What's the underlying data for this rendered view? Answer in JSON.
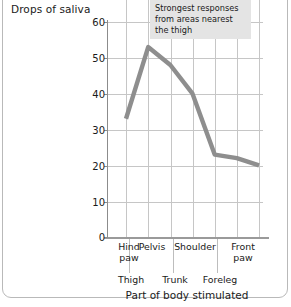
{
  "figure": {
    "annotation": "Strongest responses from areas nearest the thigh",
    "annotation_lines": [
      "Strongest responses",
      "from areas nearest",
      "the thigh"
    ],
    "frame_color": "#b9b9b9",
    "grid_color": "#c6c6c6",
    "axis_color": "#8c8c8c",
    "line_color": "#8e8e8e",
    "annotation_bg": "#e4e4e4",
    "text_color": "#1a1a1a"
  },
  "chart_data": {
    "type": "line",
    "title": "",
    "xlabel": "Part of body stimulated",
    "ylabel": "Drops of saliva",
    "categories": [
      "Hind paw",
      "Thigh",
      "Pelvis",
      "Trunk",
      "Shoulder",
      "Foreleg",
      "Front paw"
    ],
    "values": [
      33,
      53,
      48,
      40,
      23,
      22,
      20
    ],
    "ylim": [
      0,
      60
    ],
    "yticks": [
      0,
      10,
      20,
      30,
      40,
      50,
      60
    ],
    "ytick_labels": [
      "0",
      "10",
      "20",
      "30",
      "40",
      "50",
      "60"
    ],
    "grid": true,
    "legend": "none",
    "category_rows": {
      "top": [
        "Hind paw",
        "Pelvis",
        "Shoulder",
        "Front paw"
      ],
      "bottom": [
        "Thigh",
        "Trunk",
        "Foreleg"
      ]
    },
    "annotations": [
      {
        "text": "Strongest responses from areas nearest the thigh",
        "target": "Thigh"
      }
    ]
  },
  "labels": {
    "y_axis_title": "Drops of saliva",
    "x_axis_title": "Part of body stimulated",
    "x_top": [
      {
        "text_line1": "Hind",
        "text_line2": "paw"
      },
      {
        "text_line1": "Pelvis",
        "text_line2": ""
      },
      {
        "text_line1": "Shoulder",
        "text_line2": ""
      },
      {
        "text_line1": "Front",
        "text_line2": "paw"
      }
    ],
    "x_bottom": [
      "Thigh",
      "Trunk",
      "Foreleg"
    ],
    "y_ticks": [
      "60",
      "50",
      "40",
      "30",
      "20",
      "10",
      "0"
    ]
  }
}
